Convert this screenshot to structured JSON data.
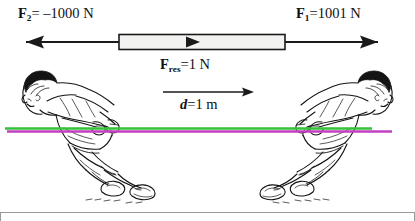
{
  "figure": {
    "background_color": "#ffffff",
    "frame_color": "#9a9a9a"
  },
  "labels": {
    "force_left": {
      "symbol": "F",
      "subscript": "2",
      "text": "= –1000 N",
      "full": "F2 = –1000 N",
      "value": -1000,
      "unit": "N"
    },
    "force_right": {
      "symbol": "F",
      "subscript": "1",
      "text": "=1001 N",
      "full": "F1 = 1001 N",
      "value": 1001,
      "unit": "N"
    },
    "force_resultant": {
      "symbol": "F",
      "subscript": "res",
      "text": "=1 N",
      "full": "Fres = 1 N",
      "value": 1,
      "unit": "N"
    },
    "distance": {
      "symbol": "d",
      "text": "=1 m",
      "full": "d = 1 m",
      "value": 1,
      "unit": "m"
    }
  },
  "diagram": {
    "arrow_color": "#1a1a1a",
    "bar_fill": "#f2f2f0",
    "bar_stroke": "#1a1a1a",
    "rope_green": "#35c13a",
    "rope_magenta": "#c23fc2",
    "figure_ink": "#141414",
    "left_arrow_direction": "left",
    "right_arrow_direction": "right",
    "resultant_marker_direction": "right",
    "distance_arrow_direction": "right"
  },
  "people": {
    "left": {
      "name": "puller-left",
      "facing": "left"
    },
    "right": {
      "name": "puller-right",
      "facing": "right"
    }
  }
}
